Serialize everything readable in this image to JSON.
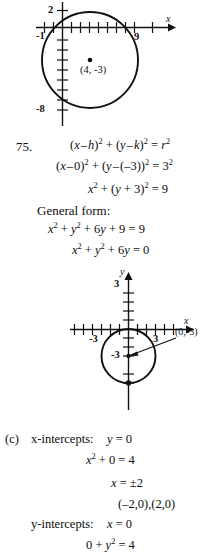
{
  "figure_top": {
    "name": "circle-graph-center-4-minus-3",
    "axis_labels": {
      "x": "x",
      "y": ""
    },
    "tick_labels": [
      {
        "text": "2",
        "axis": "y",
        "value": 2
      },
      {
        "text": "-1",
        "axis": "x",
        "value": -1
      },
      {
        "text": "9",
        "axis": "x",
        "value": 9
      },
      {
        "text": "-8",
        "axis": "y",
        "value": -8
      }
    ],
    "point_label": "(4, -3)",
    "circle": {
      "center_x": 4,
      "center_y": -3,
      "radius": 5
    }
  },
  "problem": {
    "number": "75.",
    "lines": [
      "(x - h)² + (y - k)² = r²",
      "(x - 0)² + (y - (-3))² = 3²",
      "x² + (y + 3)² = 9"
    ],
    "general_form_heading": "General form:",
    "general_form_lines": [
      "x² + y² + 6y + 9 = 9",
      "x² + y² + 6y = 0"
    ]
  },
  "figure_bottom": {
    "name": "circle-graph-center-0-minus-3",
    "axis_labels": {
      "x": "x",
      "y": "y"
    },
    "tick_labels": [
      {
        "text": "3",
        "axis": "y",
        "value": 3
      },
      {
        "text": "-3",
        "axis": "x",
        "value": -3
      },
      {
        "text": "3",
        "axis": "x",
        "value": 3
      },
      {
        "text": "-3",
        "axis": "y",
        "value": -3
      }
    ],
    "callout_label": "(0,-3)",
    "circle": {
      "center_x": 0,
      "center_y": -3,
      "radius": 3
    }
  },
  "part_c": {
    "marker": "(c)",
    "x_intercepts_label": "x-intercepts:",
    "x_intercepts_condition": "y = 0",
    "x_lines": [
      "x² + 0 = 4",
      "x = ±2",
      "(-2,0),(2,0)"
    ],
    "y_intercepts_label": "y-intercepts:",
    "y_intercepts_condition": "x = 0",
    "y_lines": [
      "0 + y² = 4"
    ]
  }
}
